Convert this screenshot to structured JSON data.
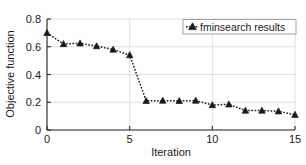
{
  "chart_data": {
    "type": "line",
    "title": "",
    "xlabel": "Iteration",
    "ylabel": "Objective function",
    "xlim": [
      0,
      15
    ],
    "ylim": [
      0,
      0.8
    ],
    "xticks": [
      0,
      5,
      10,
      15
    ],
    "xticklabels": [
      "0",
      "5",
      "10",
      "15"
    ],
    "yticks": [
      0,
      0.2,
      0.4,
      0.6,
      0.8
    ],
    "yticklabels": [
      "0",
      "0.2",
      "0.4",
      "0.6",
      "0.8"
    ],
    "grid": true,
    "legend_position": "upper right",
    "marker": "triangle",
    "linestyle": "dotted",
    "color": "#1a1a1a",
    "x": [
      0,
      1,
      2,
      3,
      4,
      5,
      6,
      7,
      8,
      9,
      10,
      11,
      12,
      13,
      14,
      15
    ],
    "series": [
      {
        "name": "fminsearch results",
        "values": [
          0.7,
          0.62,
          0.625,
          0.605,
          0.58,
          0.54,
          0.21,
          0.212,
          0.21,
          0.212,
          0.18,
          0.185,
          0.14,
          0.14,
          0.135,
          0.11
        ]
      }
    ]
  },
  "axes": {
    "y_title": "Objective function",
    "x_title": "Iteration",
    "y_tick_labels": [
      "0.8",
      "0.6",
      "0.4",
      "0.2",
      "0"
    ],
    "x_tick_labels": [
      "0",
      "5",
      "10",
      "15"
    ]
  },
  "legend": {
    "entries": [
      {
        "label": "fminsearch results",
        "marker": "triangle-marker"
      }
    ]
  }
}
